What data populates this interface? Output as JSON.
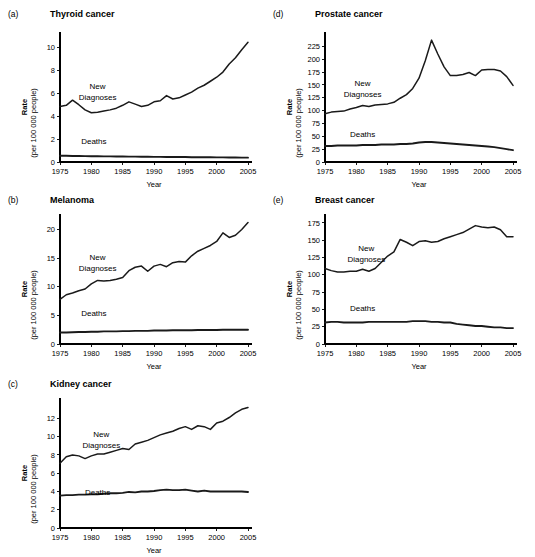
{
  "figure": {
    "width": 535,
    "height": 547,
    "background": "#ffffff",
    "line_color": "#1a1a1a",
    "axis_color": "#000000"
  },
  "common": {
    "xlabel": "Year",
    "ylabel_main": "Rate",
    "ylabel_sub": "(per 100 000 people)",
    "xticks": [
      1975,
      1980,
      1985,
      1990,
      1995,
      2000,
      2005
    ],
    "xlim": [
      1975,
      2005
    ],
    "series_names": [
      "New Diagnoses",
      "Deaths"
    ],
    "new_diagnoses_label_line1": "New",
    "new_diagnoses_label_line2": "Diagnoses",
    "deaths_label": "Deaths"
  },
  "chart_data": [
    {
      "type": "line",
      "panel": "a",
      "panel_letter": "(a)",
      "title": "Thyroid cancer",
      "xlabel": "Year",
      "ylabel": "Rate (per 100 000 people)",
      "xlim": [
        1975,
        2005
      ],
      "ylim": [
        0,
        11
      ],
      "yticks": [
        0,
        2,
        4,
        6,
        8,
        10
      ],
      "xticks": [
        1975,
        1980,
        1985,
        1990,
        1995,
        2000,
        2005
      ],
      "grid": false,
      "legend": "inline-annotation",
      "x": [
        1975,
        1976,
        1977,
        1978,
        1979,
        1980,
        1981,
        1982,
        1983,
        1984,
        1985,
        1986,
        1987,
        1988,
        1989,
        1990,
        1991,
        1992,
        1993,
        1994,
        1995,
        1996,
        1997,
        1998,
        1999,
        2000,
        2001,
        2002,
        2003,
        2004,
        2005
      ],
      "series": [
        {
          "name": "New Diagnoses",
          "values": [
            4.85,
            4.95,
            5.4,
            5.0,
            4.55,
            4.3,
            4.35,
            4.45,
            4.55,
            4.7,
            4.95,
            5.25,
            5.05,
            4.85,
            4.95,
            5.25,
            5.35,
            5.8,
            5.5,
            5.6,
            5.85,
            6.1,
            6.45,
            6.7,
            7.05,
            7.4,
            7.85,
            8.55,
            9.1,
            9.8,
            10.45
          ]
        },
        {
          "name": "Deaths",
          "values": [
            0.55,
            0.54,
            0.53,
            0.52,
            0.51,
            0.5,
            0.5,
            0.49,
            0.49,
            0.48,
            0.48,
            0.47,
            0.47,
            0.46,
            0.46,
            0.45,
            0.45,
            0.44,
            0.44,
            0.43,
            0.43,
            0.42,
            0.42,
            0.41,
            0.41,
            0.4,
            0.4,
            0.39,
            0.39,
            0.38,
            0.38
          ]
        }
      ]
    },
    {
      "type": "line",
      "panel": "d",
      "panel_letter": "(d)",
      "title": "Prostate cancer",
      "xlabel": "Year",
      "ylabel": "Rate (per 100 000 people)",
      "xlim": [
        1975,
        2005
      ],
      "ylim": [
        0,
        245
      ],
      "yticks": [
        0,
        25,
        50,
        75,
        100,
        125,
        150,
        175,
        200,
        225
      ],
      "xticks": [
        1975,
        1980,
        1985,
        1990,
        1995,
        2000,
        2005
      ],
      "grid": false,
      "legend": "inline-annotation",
      "x": [
        1975,
        1976,
        1977,
        1978,
        1979,
        1980,
        1981,
        1982,
        1983,
        1984,
        1985,
        1986,
        1987,
        1988,
        1989,
        1990,
        1991,
        1992,
        1993,
        1994,
        1995,
        1996,
        1997,
        1998,
        1999,
        2000,
        2001,
        2002,
        2003,
        2004,
        2005
      ],
      "series": [
        {
          "name": "New Diagnoses",
          "values": [
            94,
            97,
            98,
            99,
            103,
            106,
            110,
            108,
            111,
            112,
            113,
            116,
            124,
            131,
            143,
            163,
            197,
            237,
            210,
            185,
            168,
            168,
            170,
            174,
            168,
            179,
            180,
            180,
            177,
            166,
            149
          ]
        },
        {
          "name": "Deaths",
          "values": [
            31,
            31,
            32,
            32,
            32,
            32,
            33,
            33,
            33,
            34,
            34,
            34,
            35,
            35,
            36,
            38,
            39,
            39,
            38,
            37,
            36,
            35,
            34,
            33,
            32,
            31,
            30,
            29,
            27,
            25,
            23
          ]
        }
      ]
    },
    {
      "type": "line",
      "panel": "b",
      "panel_letter": "(b)",
      "title": "Melanoma",
      "xlabel": "Year",
      "ylabel": "Rate (per 100 000 people)",
      "xlim": [
        1975,
        2005
      ],
      "ylim": [
        0,
        22
      ],
      "yticks": [
        0,
        5,
        10,
        15,
        20
      ],
      "xticks": [
        1975,
        1980,
        1985,
        1990,
        1995,
        2000,
        2005
      ],
      "grid": false,
      "legend": "inline-annotation",
      "x": [
        1975,
        1976,
        1977,
        1978,
        1979,
        1980,
        1981,
        1982,
        1983,
        1984,
        1985,
        1986,
        1987,
        1988,
        1989,
        1990,
        1991,
        1992,
        1993,
        1994,
        1995,
        1996,
        1997,
        1998,
        1999,
        2000,
        2001,
        2002,
        2003,
        2004,
        2005
      ],
      "series": [
        {
          "name": "New Diagnoses",
          "values": [
            7.8,
            8.6,
            8.9,
            9.3,
            9.6,
            10.5,
            11.1,
            11.0,
            11.1,
            11.3,
            11.6,
            12.8,
            13.4,
            13.6,
            12.7,
            13.6,
            13.9,
            13.5,
            14.2,
            14.4,
            14.3,
            15.4,
            16.2,
            16.7,
            17.2,
            17.9,
            19.4,
            18.6,
            19.0,
            20.0,
            21.2
          ]
        },
        {
          "name": "Deaths",
          "values": [
            2.0,
            2.0,
            2.05,
            2.1,
            2.1,
            2.15,
            2.15,
            2.2,
            2.2,
            2.2,
            2.25,
            2.25,
            2.3,
            2.3,
            2.3,
            2.35,
            2.35,
            2.35,
            2.4,
            2.4,
            2.4,
            2.4,
            2.45,
            2.45,
            2.45,
            2.45,
            2.5,
            2.5,
            2.5,
            2.5,
            2.5
          ]
        }
      ]
    },
    {
      "type": "line",
      "panel": "e",
      "panel_letter": "(e)",
      "title": "Breast cancer",
      "xlabel": "Year",
      "ylabel": "Rate (per 100 000 people)",
      "xlim": [
        1975,
        2005
      ],
      "ylim": [
        0,
        182
      ],
      "yticks": [
        0,
        25,
        50,
        75,
        100,
        125,
        150,
        175
      ],
      "xticks": [
        1975,
        1980,
        1985,
        1990,
        1995,
        2000,
        2005
      ],
      "grid": false,
      "legend": "inline-annotation",
      "x": [
        1975,
        1976,
        1977,
        1978,
        1979,
        1980,
        1981,
        1982,
        1983,
        1984,
        1985,
        1986,
        1987,
        1988,
        1989,
        1990,
        1991,
        1992,
        1993,
        1994,
        1995,
        1996,
        1997,
        1998,
        1999,
        2000,
        2001,
        2002,
        2003,
        2004,
        2005
      ],
      "series": [
        {
          "name": "New Diagnoses",
          "values": [
            109,
            106,
            104,
            104,
            105,
            105,
            108,
            105,
            109,
            118,
            127,
            133,
            151,
            147,
            142,
            148,
            149,
            147,
            148,
            152,
            155,
            158,
            161,
            166,
            171,
            169,
            168,
            169,
            165,
            155,
            155
          ]
        },
        {
          "name": "Deaths",
          "values": [
            31,
            32,
            32,
            31,
            31,
            31,
            31,
            32,
            32,
            32,
            32,
            32,
            32,
            32,
            33,
            33,
            33,
            32,
            32,
            31,
            31,
            29,
            28,
            27,
            26,
            26,
            25,
            24,
            24,
            23,
            23
          ]
        }
      ]
    },
    {
      "type": "line",
      "panel": "c",
      "panel_letter": "(c)",
      "title": "Kidney cancer",
      "xlabel": "Year",
      "ylabel": "Rate (per 100 000 people)",
      "xlim": [
        1975,
        2005
      ],
      "ylim": [
        0,
        13.8
      ],
      "yticks": [
        0,
        2,
        4,
        6,
        8,
        10,
        12
      ],
      "xticks": [
        1975,
        1980,
        1985,
        1990,
        1995,
        2000,
        2005
      ],
      "grid": false,
      "legend": "inline-annotation",
      "x": [
        1975,
        1976,
        1977,
        1978,
        1979,
        1980,
        1981,
        1982,
        1983,
        1984,
        1985,
        1986,
        1987,
        1988,
        1989,
        1990,
        1991,
        1992,
        1993,
        1994,
        1995,
        1996,
        1997,
        1998,
        1999,
        2000,
        2001,
        2002,
        2003,
        2004,
        2005
      ],
      "series": [
        {
          "name": "New Diagnoses",
          "values": [
            7.1,
            7.8,
            8.0,
            7.9,
            7.6,
            7.9,
            8.1,
            8.1,
            8.3,
            8.5,
            8.7,
            8.6,
            9.2,
            9.4,
            9.6,
            9.9,
            10.2,
            10.4,
            10.6,
            10.9,
            11.1,
            10.8,
            11.2,
            11.1,
            10.8,
            11.5,
            11.7,
            12.1,
            12.6,
            13.0,
            13.2
          ]
        },
        {
          "name": "Deaths",
          "values": [
            3.55,
            3.6,
            3.6,
            3.65,
            3.65,
            3.7,
            3.7,
            3.75,
            3.8,
            3.8,
            3.85,
            3.95,
            3.9,
            4.0,
            4.0,
            4.05,
            4.15,
            4.2,
            4.15,
            4.15,
            4.2,
            4.1,
            4.0,
            4.1,
            4.0,
            4.0,
            4.0,
            4.0,
            4.0,
            4.0,
            3.95
          ]
        }
      ]
    }
  ],
  "panel_layout": [
    {
      "id": "a",
      "left": 8,
      "top": 8,
      "plot_left": 52,
      "plot_top": 28,
      "plot_width": 188,
      "plot_height": 126,
      "nd_label_x": 0.2,
      "nd_label_y": 0.42,
      "deaths_label_x": 0.18,
      "deaths_label_y": 0.86
    },
    {
      "id": "d",
      "left": 273,
      "top": 8,
      "plot_left": 52,
      "plot_top": 28,
      "plot_width": 188,
      "plot_height": 126,
      "nd_label_x": 0.2,
      "nd_label_y": 0.4,
      "deaths_label_x": 0.2,
      "deaths_label_y": 0.8
    },
    {
      "id": "b",
      "left": 8,
      "top": 194,
      "plot_left": 52,
      "plot_top": 24,
      "plot_width": 188,
      "plot_height": 126,
      "nd_label_x": 0.2,
      "nd_label_y": 0.33,
      "deaths_label_x": 0.18,
      "deaths_label_y": 0.78
    },
    {
      "id": "e",
      "left": 273,
      "top": 194,
      "plot_left": 52,
      "plot_top": 24,
      "plot_width": 188,
      "plot_height": 126,
      "nd_label_x": 0.22,
      "nd_label_y": 0.26,
      "deaths_label_x": 0.2,
      "deaths_label_y": 0.74
    },
    {
      "id": "c",
      "left": 8,
      "top": 378,
      "plot_left": 52,
      "plot_top": 24,
      "plot_width": 188,
      "plot_height": 126,
      "nd_label_x": 0.22,
      "nd_label_y": 0.28,
      "deaths_label_x": 0.2,
      "deaths_label_y": 0.74
    }
  ]
}
